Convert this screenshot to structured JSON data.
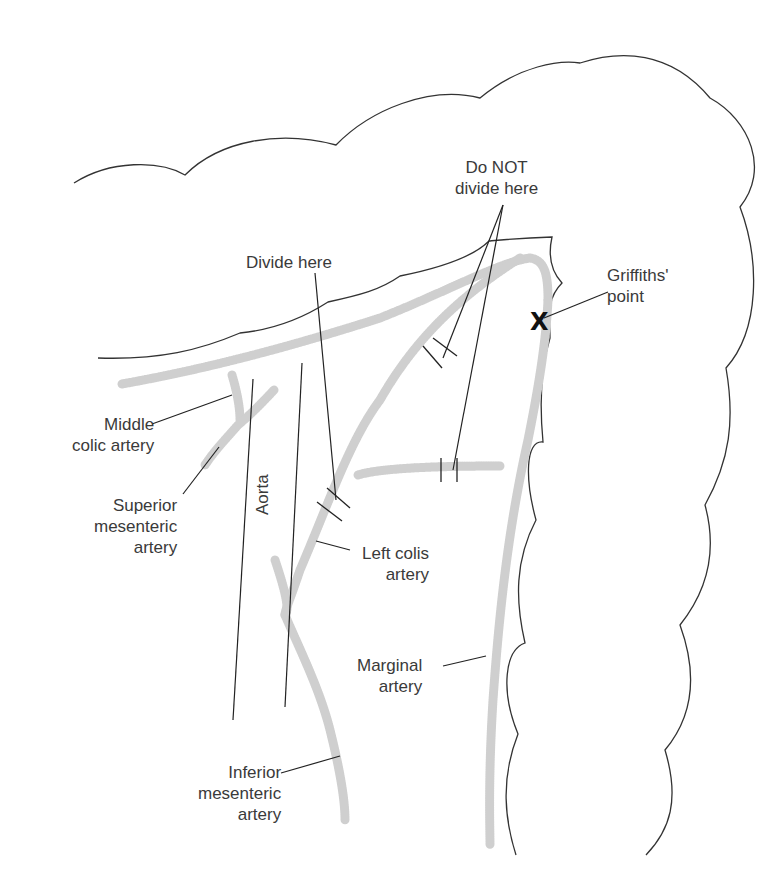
{
  "diagram": {
    "labels": {
      "do_not_divide": "Do NOT\ndivide here",
      "divide_here": "Divide here",
      "griffiths_point": "Griffiths'\npoint",
      "middle_colic": "Middle\ncolic artery",
      "superior_mesenteric": "Superior\nmesenteric\nartery",
      "aorta": "Aorta",
      "left_colic": "Left colis\nartery",
      "marginal": "Marginal\nartery",
      "inferior_mesenteric": "Inferior\nmesenteric\nartery"
    },
    "marker": {
      "symbol": "X",
      "meaning": "Griffiths' point"
    },
    "colors": {
      "outline": "#333333",
      "vessel": "#d0d0d0",
      "text": "#3a3a3a"
    }
  }
}
